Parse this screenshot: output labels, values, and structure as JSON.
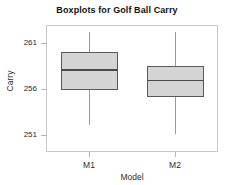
{
  "chart_data": {
    "type": "box",
    "title": "Boxplots for Golf Ball Carry",
    "xlabel": "Model",
    "ylabel": "Carry",
    "categories": [
      "M1",
      "M2"
    ],
    "ytick_labels": [
      "261",
      "256",
      "251"
    ],
    "ytick_values": [
      261,
      256,
      251
    ],
    "ylim": [
      249.2,
      262.9
    ],
    "grid": false,
    "legend": null,
    "colors": {
      "box_fill": "#d4d4d4",
      "box_edge": "#595959",
      "median": "#4a4a4a",
      "whisker": "#9a9a9a",
      "frame": "#c9c9c9"
    },
    "series": [
      {
        "name": "M1",
        "whisker_low": 252.1,
        "q1": 255.9,
        "median": 258.1,
        "q3": 260.0,
        "whisker_high": 262.1
      },
      {
        "name": "M2",
        "whisker_low": 251.1,
        "q1": 255.1,
        "median": 257.0,
        "q3": 258.5,
        "whisker_high": 262.1
      }
    ]
  }
}
